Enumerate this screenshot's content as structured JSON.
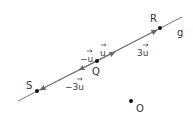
{
  "diagram": {
    "line_label": "g",
    "points": {
      "S": {
        "label": "S",
        "x": 37,
        "y": 91
      },
      "Q": {
        "label": "Q",
        "x": 97,
        "y": 61
      },
      "R": {
        "label": "R",
        "x": 160,
        "y": 28
      },
      "O": {
        "label": "O",
        "x": 131,
        "y": 101
      }
    },
    "vectors": {
      "u": {
        "label": "u",
        "prefix": ""
      },
      "neg_u": {
        "label": "u",
        "prefix": "−"
      },
      "three_u": {
        "label": "u",
        "prefix": "3"
      },
      "neg_three_u": {
        "label": "u",
        "prefix": "−3"
      }
    },
    "colors": {
      "line": "#666666",
      "point": "#111111",
      "text": "#333333"
    }
  }
}
